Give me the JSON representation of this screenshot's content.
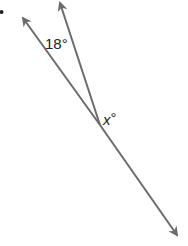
{
  "diagram": {
    "type": "angle-diagram",
    "line_color": "#6b6b6b",
    "vertex": [
      100,
      125
    ],
    "rays": [
      {
        "name": "left-ray",
        "tip": [
          22,
          17
        ]
      },
      {
        "name": "middle-ray",
        "tip": [
          60,
          2
        ]
      },
      {
        "name": "lower-right-ray",
        "tip": [
          178,
          236
        ]
      }
    ],
    "labels": {
      "angle_known": "18°",
      "angle_unknown_var": "x",
      "angle_unknown_deg": "°"
    },
    "bullet": "•"
  }
}
